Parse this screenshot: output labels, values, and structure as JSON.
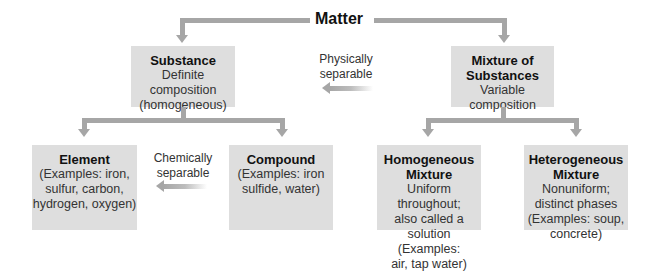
{
  "root": {
    "label": "Matter"
  },
  "substance": {
    "title": "Substance",
    "description": "Definite\ncomposition\n(homogeneous)"
  },
  "mixture": {
    "title": "Mixture of\nSubstances",
    "description": "Variable\ncomposition"
  },
  "physical_separation": {
    "label": "Physically\nseparable"
  },
  "chemical_separation": {
    "label": "Chemically\nseparable"
  },
  "element": {
    "title": "Element",
    "description": "(Examples: iron,\nsulfur, carbon,\nhydrogen, oxygen)"
  },
  "compound": {
    "title": "Compound",
    "description": "(Examples: iron\nsulfide, water)"
  },
  "homogeneous_mixture": {
    "title": "Homogeneous\nMixture",
    "description": "Uniform throughout;\nalso called a\nsolution (Examples:\nair, tap water)"
  },
  "heterogeneous_mixture": {
    "title": "Heterogeneous\nMixture",
    "description": "Nonuniform;\ndistinct phases\n(Examples: soup,\nconcrete)"
  },
  "colors": {
    "box_fill": "#dedede",
    "connector": "#a6a6a6",
    "text": "#1a1a1a"
  }
}
